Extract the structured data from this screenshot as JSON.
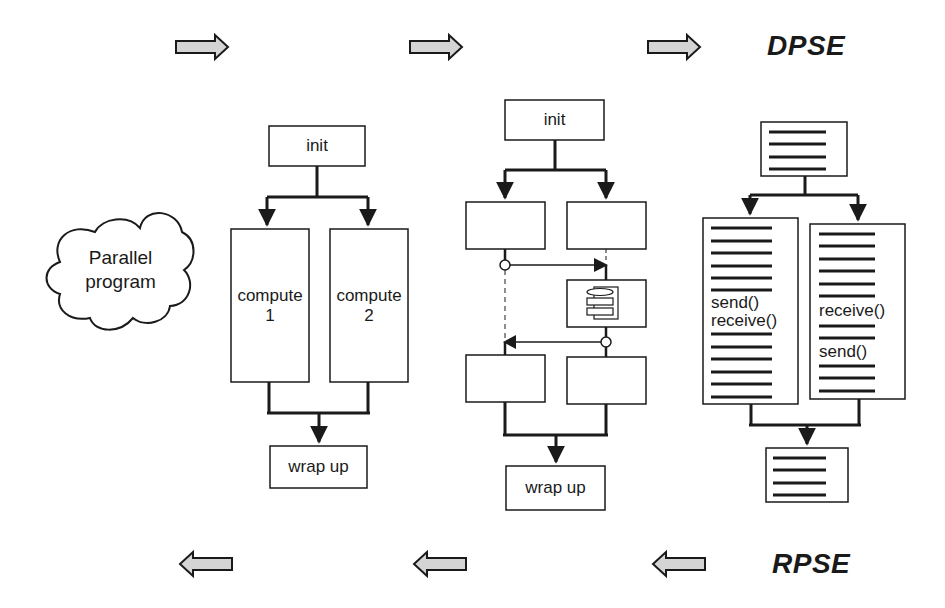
{
  "diagram": {
    "title_top": "DPSE",
    "title_bottom": "RPSE",
    "colors": {
      "stroke": "#1a1a1a",
      "arrow_fill": "#d4d4d4",
      "background": "#ffffff"
    },
    "cloud": {
      "line1": "Parallel",
      "line2": "program"
    },
    "stage1": {
      "init": "init",
      "compute1_line1": "compute",
      "compute1_line2": "1",
      "compute2_line1": "compute",
      "compute2_line2": "2",
      "wrap": "wrap up"
    },
    "stage2": {
      "init": "init",
      "wrap": "wrap up",
      "middle_icon": "storage-stack-icon"
    },
    "stage3": {
      "left_send": "send()",
      "left_receive": "receive()",
      "right_receive": "receive()",
      "right_send": "send()"
    },
    "top_arrows": [
      "right-arrow",
      "right-arrow",
      "right-arrow"
    ],
    "bottom_arrows": [
      "left-arrow",
      "left-arrow",
      "left-arrow"
    ]
  }
}
